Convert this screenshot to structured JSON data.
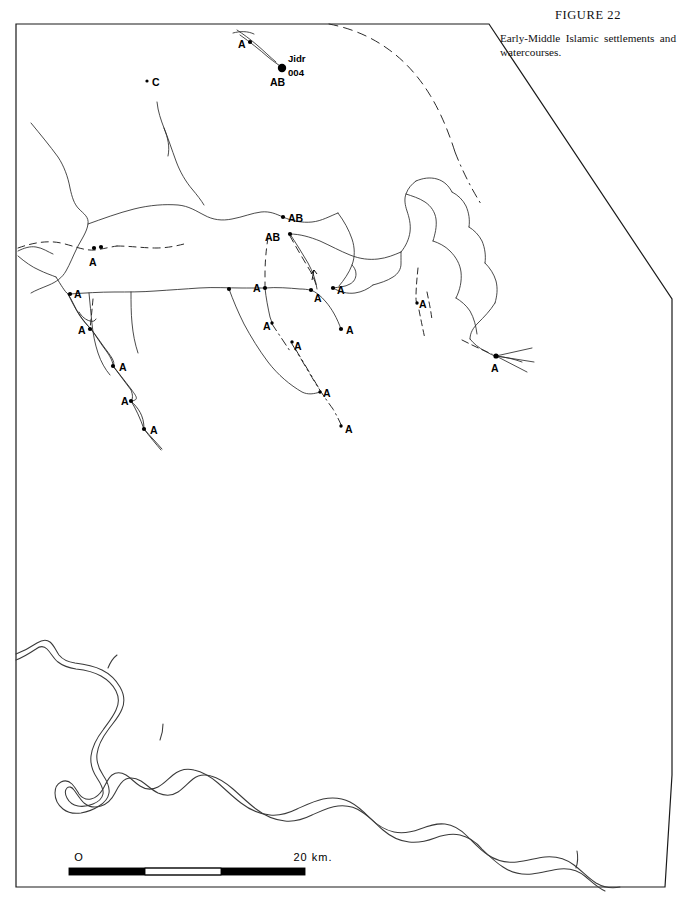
{
  "figure": {
    "number_label": "FIGURE 22",
    "caption": "Early-Middle Islamic settlements and watercourses."
  },
  "scale_bar": {
    "start_label": "O",
    "end_label": "20 km.",
    "length_km": 20,
    "segments": 4
  },
  "named_sites": {
    "jidr_name": "Jidr",
    "jidr_number": "004",
    "jidr_period": "AB"
  },
  "site_labels": [
    {
      "id": "s01",
      "text": "A",
      "x": 238,
      "y": 48,
      "dot_x": 250,
      "dot_y": 42
    },
    {
      "id": "s02",
      "text": "AB",
      "x": 270,
      "y": 86,
      "dot_x": 282,
      "dot_y": 68
    },
    {
      "id": "s03",
      "text": "C",
      "x": 152,
      "y": 86,
      "dot_x": 147,
      "dot_y": 81
    },
    {
      "id": "s04",
      "text": "AB",
      "x": 288,
      "y": 222,
      "dot_x": 283,
      "dot_y": 217
    },
    {
      "id": "s05",
      "text": "AB",
      "x": 271,
      "y": 241,
      "dot_x": 290,
      "dot_y": 234
    },
    {
      "id": "s06",
      "text": "A",
      "x": 89,
      "y": 266,
      "dot_x": 94,
      "dot_y": 248
    },
    {
      "id": "s07",
      "text": "A",
      "x": 253,
      "y": 292,
      "dot_x": 265,
      "dot_y": 288
    },
    {
      "id": "s08",
      "text": "A",
      "x": 317,
      "y": 298,
      "dot_x": 311,
      "dot_y": 290
    },
    {
      "id": "s09",
      "text": "A",
      "x": 339,
      "y": 294,
      "dot_x": 333,
      "dot_y": 288
    },
    {
      "id": "s10",
      "text": "A",
      "x": 74,
      "y": 298,
      "dot_x": 70,
      "dot_y": 294
    },
    {
      "id": "s11",
      "text": "A",
      "x": 79,
      "y": 334,
      "dot_x": 90,
      "dot_y": 329
    },
    {
      "id": "s12",
      "text": "A",
      "x": 119,
      "y": 370,
      "dot_x": 113,
      "dot_y": 366
    },
    {
      "id": "s13",
      "text": "A",
      "x": 124,
      "y": 404,
      "dot_x": 131,
      "dot_y": 401
    },
    {
      "id": "s14",
      "text": "A",
      "x": 151,
      "y": 434,
      "dot_x": 144,
      "dot_y": 429
    },
    {
      "id": "s15",
      "text": "A",
      "x": 266,
      "y": 329,
      "dot_x": 272,
      "dot_y": 323
    },
    {
      "id": "s16",
      "text": "A",
      "x": 296,
      "y": 348,
      "dot_x": 292,
      "dot_y": 342
    },
    {
      "id": "s17",
      "text": "A",
      "x": 348,
      "y": 334,
      "dot_x": 341,
      "dot_y": 329
    },
    {
      "id": "s18",
      "text": "A",
      "x": 325,
      "y": 396,
      "dot_x": 320,
      "dot_y": 392
    },
    {
      "id": "s19",
      "text": "A",
      "x": 347,
      "y": 432,
      "dot_x": 341,
      "dot_y": 426
    },
    {
      "id": "s20",
      "text": "A",
      "x": 422,
      "y": 308,
      "dot_x": 417,
      "dot_y": 303
    },
    {
      "id": "s21",
      "text": "A",
      "x": 493,
      "y": 371,
      "dot_x": 496,
      "dot_y": 356
    }
  ],
  "map_elements": {
    "border_name": "survey-area-boundary",
    "river_name": "euphrates-channel",
    "watercourse_name": "ancient-watercourse"
  }
}
